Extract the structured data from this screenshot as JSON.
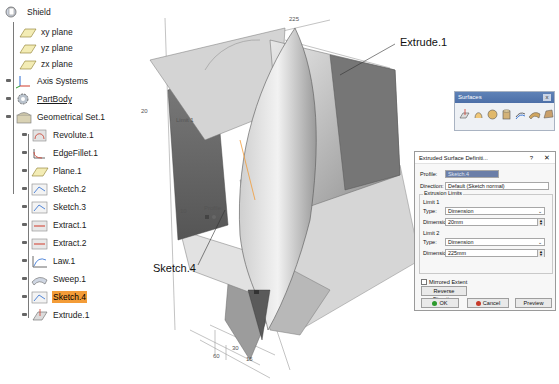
{
  "tree": {
    "root": {
      "label": "Shield",
      "icon": "document-tree-icon"
    },
    "items": [
      {
        "label": "xy plane",
        "icon": "plane-icon"
      },
      {
        "label": "yz plane",
        "icon": "plane-icon"
      },
      {
        "label": "zx plane",
        "icon": "plane-icon"
      },
      {
        "label": "Axis Systems",
        "icon": "axis-system-icon"
      },
      {
        "label": "PartBody",
        "icon": "partbody-gear-icon",
        "underlined": true
      },
      {
        "label": "Geometrical Set.1",
        "icon": "geometrical-set-icon"
      }
    ],
    "geoset_children": [
      {
        "label": "Revolute.1",
        "icon": "revolute-icon"
      },
      {
        "label": "EdgeFillet.1",
        "icon": "edge-fillet-icon"
      },
      {
        "label": "Plane.1",
        "icon": "plane-icon"
      },
      {
        "label": "Sketch.2",
        "icon": "sketch-icon"
      },
      {
        "label": "Sketch.3",
        "icon": "sketch-icon"
      },
      {
        "label": "Extract.1",
        "icon": "extract-icon"
      },
      {
        "label": "Extract.2",
        "icon": "extract-icon"
      },
      {
        "label": "Law.1",
        "icon": "law-icon"
      },
      {
        "label": "Sweep.1",
        "icon": "sweep-icon"
      },
      {
        "label": "Sketch.4",
        "icon": "sketch-icon",
        "selected": true
      },
      {
        "label": "Extrude.1",
        "icon": "extrude-icon"
      }
    ]
  },
  "viewport": {
    "callouts": {
      "extrude": "Extrude.1",
      "sketch": "Sketch.4"
    },
    "dimensions": {
      "top": "225",
      "left": "20",
      "limit": "Limit 1",
      "angle": "10",
      "profile": "Profile",
      "d1": "60",
      "d2": "30",
      "d3": "15"
    },
    "colors": {
      "surface_light": "#d9d9d9",
      "surface_dark": "#6f6f6f",
      "surface_mid": "#a8a8a8",
      "highlight": "#f39c38"
    }
  },
  "toolbar": {
    "title": "Surfaces",
    "close": "x",
    "icons": [
      "extrude-surface-icon",
      "revolve-surface-icon",
      "sphere-surface-icon",
      "cylinder-surface-icon",
      "offset-surface-icon",
      "sweep-surface-icon",
      "fill-surface-icon"
    ]
  },
  "dialog": {
    "title": "Extruded Surface Definiti...",
    "help": "?",
    "close": "✕",
    "profile_label": "Profile:",
    "profile_value": "Sketch.4",
    "direction_label": "Direction:",
    "direction_value": "Default (Sketch normal)",
    "limits_group": "Extrusion Limits",
    "limit1": {
      "title": "Limit 1",
      "type_label": "Type:",
      "type_value": "Dimension",
      "dimension_label": "Dimension:",
      "dimension_value": "20mm"
    },
    "limit2": {
      "title": "Limit 2",
      "type_label": "Type:",
      "type_value": "Dimension",
      "dimension_label": "Dimension:",
      "dimension_value": "225mm"
    },
    "mirrored_extent": "Mirrored Extent",
    "reverse_direction": "Reverse Direction",
    "ok": "OK",
    "cancel": "Cancel",
    "preview": "Preview"
  }
}
